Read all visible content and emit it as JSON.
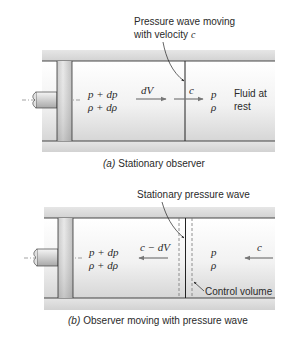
{
  "panel_a": {
    "annotation_line1": "Pressure wave moving",
    "annotation_line2": "with velocity",
    "annotation_var": "c",
    "left_state_p": "p + dp",
    "left_state_rho": "ρ + dρ",
    "velocity_label_left": "dV",
    "velocity_label_wave": "c",
    "right_state_p": "p",
    "right_state_rho": "ρ",
    "fluid_label_line1": "Fluid at",
    "fluid_label_line2": "rest",
    "caption_letter": "(a)",
    "caption_text": "Stationary observer"
  },
  "panel_b": {
    "annotation": "Stationary pressure wave",
    "left_state_p": "p + dp",
    "left_state_rho": "ρ + dρ",
    "velocity_label_left": "c − dV",
    "right_state_p": "p",
    "right_state_rho": "ρ",
    "velocity_label_right": "c",
    "control_volume_label": "Control volume",
    "caption_letter": "(b)",
    "caption_text": "Observer moving with pressure wave"
  },
  "colors": {
    "line": "#333333",
    "wall": "#dcdcdc",
    "text": "#2a2a2a",
    "arrow": "#777777"
  }
}
